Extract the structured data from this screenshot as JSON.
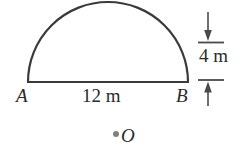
{
  "figure": {
    "kind": "geometry-diagram",
    "background_color": "#ffffff",
    "stroke_color": "#3a3a3a",
    "text_color": "#2b2b2b",
    "dot_color": "#808080"
  },
  "labels": {
    "point_a": "A",
    "point_b": "B",
    "span": "12 m",
    "height": "4 m",
    "point_o": "O"
  },
  "geometry": {
    "chord": {
      "x1": 28,
      "y1": 82,
      "x2": 188,
      "y2": 82
    },
    "arc": {
      "start_x": 28,
      "start_y": 82,
      "end_x": 188,
      "end_y": 82,
      "apex_x": 108,
      "apex_y": 45,
      "radius": 63,
      "sagitta": 37
    },
    "dimension_line": {
      "x": 208,
      "top_y": 12,
      "bottom_y": 106,
      "tick_top_y": 42,
      "tick_bottom_y": 80,
      "tick_x1": 198,
      "tick_x2": 224
    },
    "point_o": {
      "x": 116,
      "y": 134,
      "radius": 3
    }
  },
  "measurements": {
    "span_value": 12,
    "span_unit": "m",
    "height_value": 4,
    "height_unit": "m"
  }
}
